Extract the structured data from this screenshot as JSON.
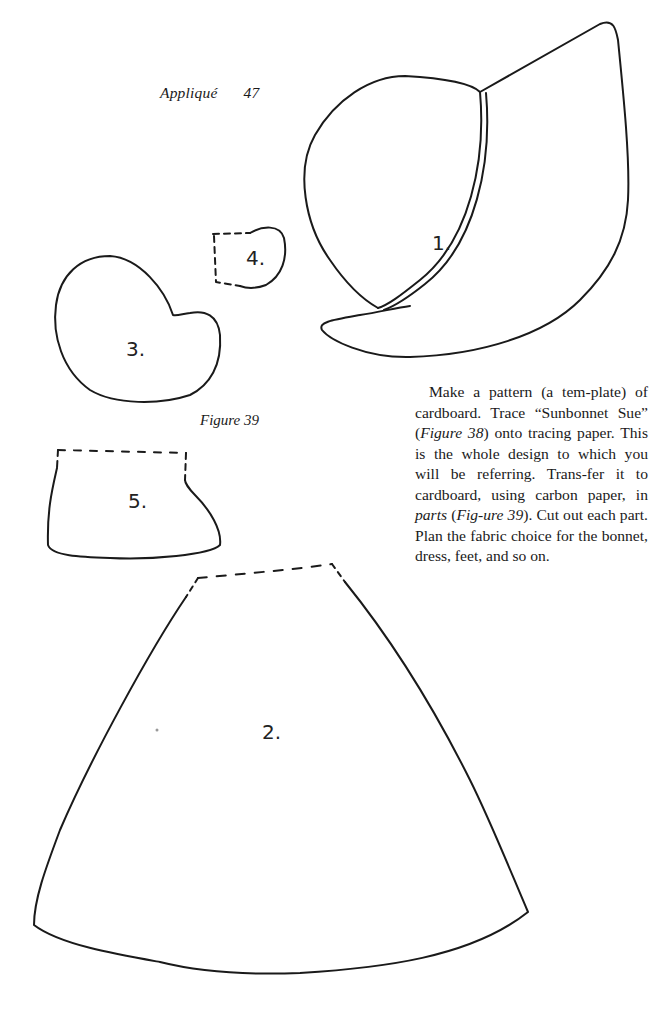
{
  "page": {
    "running_head": "Appliqué",
    "page_number": "47",
    "figure_caption": "Figure 39",
    "body_paragraph": [
      {
        "text": "Make a pattern (a tem-plate) of cardboard. Trace “Sunbonnet Sue” (",
        "italic": false
      },
      {
        "text": "Figure 38",
        "italic": true
      },
      {
        "text": ") onto tracing paper. This is the whole design to which you will be referring. Trans-fer it to cardboard, using carbon paper, in ",
        "italic": false
      },
      {
        "text": "parts",
        "italic": true
      },
      {
        "text": " (",
        "italic": false
      },
      {
        "text": "Fig-ure 39",
        "italic": true
      },
      {
        "text": "). Cut out each part. Plan the fabric choice for the bonnet, dress, feet, and so on.",
        "italic": false
      }
    ]
  },
  "figure": {
    "pieces": [
      {
        "id": "1",
        "label": "1.",
        "name": "bonnet"
      },
      {
        "id": "2",
        "label": "2.",
        "name": "dress"
      },
      {
        "id": "3",
        "label": "3.",
        "name": "sleeve"
      },
      {
        "id": "4",
        "label": "4.",
        "name": "hand"
      },
      {
        "id": "5",
        "label": "5.",
        "name": "foot"
      }
    ],
    "line_color": "#1a1a1a"
  }
}
